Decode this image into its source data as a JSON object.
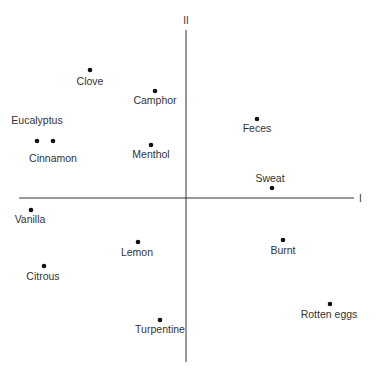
{
  "chart_data": {
    "type": "scatter",
    "title": "",
    "xlabel": "I",
    "ylabel": "II",
    "grid": false,
    "legend": null,
    "axis_style": "crossed axes at origin, no ticks",
    "points": [
      {
        "label": "Clove",
        "px": 90,
        "py": 70,
        "lx": 90,
        "ly": 85,
        "anchor": "middle"
      },
      {
        "label": "Camphor",
        "px": 155,
        "py": 91,
        "lx": 155,
        "ly": 104,
        "anchor": "middle"
      },
      {
        "label": "Eucalyptus",
        "px": 37,
        "py": 141,
        "lx": 37,
        "ly": 124,
        "anchor": "middle"
      },
      {
        "label": "Cinnamon",
        "px": 53,
        "py": 141,
        "lx": 53,
        "ly": 162,
        "anchor": "middle"
      },
      {
        "label": "Menthol",
        "px": 151,
        "py": 145,
        "lx": 151,
        "ly": 158,
        "anchor": "middle"
      },
      {
        "label": "Feces",
        "px": 257,
        "py": 119,
        "lx": 257,
        "ly": 132,
        "anchor": "middle"
      },
      {
        "label": "Sweat",
        "px": 272,
        "py": 188,
        "lx": 270,
        "ly": 182,
        "anchor": "middle"
      },
      {
        "label": "Vanilla",
        "px": 31,
        "py": 210,
        "lx": 30,
        "ly": 223,
        "anchor": "middle"
      },
      {
        "label": "Lemon",
        "px": 138,
        "py": 242,
        "lx": 137,
        "ly": 256,
        "anchor": "middle"
      },
      {
        "label": "Citrous",
        "px": 44,
        "py": 266,
        "lx": 43,
        "ly": 280,
        "anchor": "middle"
      },
      {
        "label": "Burnt",
        "px": 283,
        "py": 240,
        "lx": 283,
        "ly": 254,
        "anchor": "middle"
      },
      {
        "label": "Rotten eggs",
        "px": 330,
        "py": 304,
        "lx": 329,
        "ly": 318,
        "anchor": "middle"
      },
      {
        "label": "Turpentine",
        "px": 160,
        "py": 320,
        "lx": 160,
        "ly": 333,
        "anchor": "middle"
      }
    ],
    "estimated_values": [
      {
        "label": "Clove",
        "x": -0.57,
        "y": 0.77
      },
      {
        "label": "Camphor",
        "x": -0.18,
        "y": 0.64
      },
      {
        "label": "Eucalyptus",
        "x": -0.89,
        "y": 0.34
      },
      {
        "label": "Cinnamon",
        "x": -0.8,
        "y": 0.34
      },
      {
        "label": "Menthol",
        "x": -0.21,
        "y": 0.32
      },
      {
        "label": "Feces",
        "x": 0.43,
        "y": 0.48
      },
      {
        "label": "Sweat",
        "x": 0.51,
        "y": 0.06
      },
      {
        "label": "Vanilla",
        "x": -0.93,
        "y": -0.07
      },
      {
        "label": "Lemon",
        "x": -0.29,
        "y": -0.27
      },
      {
        "label": "Citrous",
        "x": -0.85,
        "y": -0.41
      },
      {
        "label": "Burnt",
        "x": 0.58,
        "y": -0.25
      },
      {
        "label": "Rotten eggs",
        "x": 0.86,
        "y": -0.64
      },
      {
        "label": "Turpentine",
        "x": -0.16,
        "y": -0.73
      }
    ],
    "xlim": [
      -1,
      1
    ],
    "ylim": [
      -1,
      1
    ]
  },
  "axes": {
    "x_label": "I",
    "y_label": "II",
    "origin_px": [
      186,
      198
    ],
    "x_range_px": [
      19,
      354
    ],
    "y_range_px": [
      30,
      362
    ],
    "color": "#333333"
  },
  "style": {
    "point_color": "#111111",
    "point_radius": 2.3
  }
}
